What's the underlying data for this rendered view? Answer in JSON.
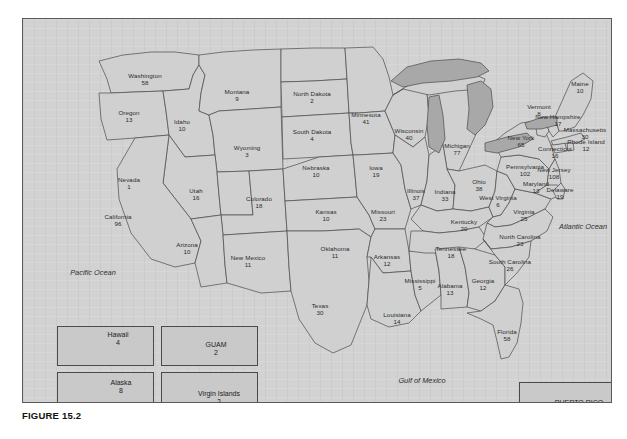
{
  "figure": {
    "caption": "FIGURE 15.2"
  },
  "map": {
    "ocean_labels": [
      {
        "name": "pacific-ocean",
        "text": "Pacific Ocean",
        "x": 70,
        "y": 253
      },
      {
        "name": "atlantic-ocean",
        "text": "Atlantic Ocean",
        "x": 560,
        "y": 207
      },
      {
        "name": "gulf-of-mexico",
        "text": "Gulf of Mexico",
        "x": 399,
        "y": 361
      }
    ],
    "states": [
      {
        "name": "washington",
        "label": "Washington",
        "value": "58",
        "x": 122,
        "y": 60
      },
      {
        "name": "oregon",
        "label": "Oregon",
        "value": "13",
        "x": 106,
        "y": 97
      },
      {
        "name": "idaho",
        "label": "Idaho",
        "value": "10",
        "x": 159,
        "y": 106
      },
      {
        "name": "montana",
        "label": "Montana",
        "value": "9",
        "x": 214,
        "y": 76
      },
      {
        "name": "wyoming",
        "label": "Wyoming",
        "value": "3",
        "x": 224,
        "y": 132
      },
      {
        "name": "nevada",
        "label": "Nevada",
        "value": "1",
        "x": 106,
        "y": 164
      },
      {
        "name": "utah",
        "label": "Utah",
        "value": "16",
        "x": 173,
        "y": 175
      },
      {
        "name": "california",
        "label": "California",
        "value": "96",
        "x": 95,
        "y": 201
      },
      {
        "name": "colorado",
        "label": "Colorado",
        "value": "18",
        "x": 236,
        "y": 183
      },
      {
        "name": "arizona",
        "label": "Arizona",
        "value": "10",
        "x": 164,
        "y": 229
      },
      {
        "name": "new-mexico",
        "label": "New Mexico",
        "value": "11",
        "x": 225,
        "y": 242
      },
      {
        "name": "north-dakota",
        "label": "North Dakota",
        "value": "2",
        "x": 289,
        "y": 78
      },
      {
        "name": "south-dakota",
        "label": "South Dakota",
        "value": "4",
        "x": 289,
        "y": 116
      },
      {
        "name": "nebraska",
        "label": "Nebraska",
        "value": "10",
        "x": 293,
        "y": 152
      },
      {
        "name": "kansas",
        "label": "Kansas",
        "value": "10",
        "x": 303,
        "y": 196
      },
      {
        "name": "oklahoma",
        "label": "Oklahoma",
        "value": "11",
        "x": 312,
        "y": 233
      },
      {
        "name": "texas",
        "label": "Texas",
        "value": "30",
        "x": 297,
        "y": 290
      },
      {
        "name": "minnesota",
        "label": "Minnesota",
        "value": "41",
        "x": 343,
        "y": 99
      },
      {
        "name": "iowa",
        "label": "Iowa",
        "value": "19",
        "x": 353,
        "y": 152
      },
      {
        "name": "missouri",
        "label": "Missouri",
        "value": "23",
        "x": 360,
        "y": 196
      },
      {
        "name": "arkansas",
        "label": "Arkansas",
        "value": "12",
        "x": 364,
        "y": 241
      },
      {
        "name": "louisiana",
        "label": "Louisiana",
        "value": "14",
        "x": 374,
        "y": 299
      },
      {
        "name": "wisconsin",
        "label": "Wisconsin",
        "value": "40",
        "x": 386,
        "y": 115
      },
      {
        "name": "illinois",
        "label": "Illinois",
        "value": "37",
        "x": 393,
        "y": 175
      },
      {
        "name": "mississippi",
        "label": "Mississippi",
        "value": "5",
        "x": 397,
        "y": 265
      },
      {
        "name": "michigan",
        "label": "Michigan",
        "value": "77",
        "x": 434,
        "y": 130
      },
      {
        "name": "indiana",
        "label": "Indiana",
        "value": "33",
        "x": 422,
        "y": 176
      },
      {
        "name": "tennessee",
        "label": "Tennessee",
        "value": "18",
        "x": 428,
        "y": 233
      },
      {
        "name": "alabama",
        "label": "Alabama",
        "value": "13",
        "x": 427,
        "y": 270
      },
      {
        "name": "georgia",
        "label": "Georgia",
        "value": "12",
        "x": 460,
        "y": 265
      },
      {
        "name": "ohio",
        "label": "Ohio",
        "value": "38",
        "x": 456,
        "y": 166
      },
      {
        "name": "kentucky",
        "label": "Kentucky",
        "value": "20",
        "x": 441,
        "y": 206
      },
      {
        "name": "west-virginia",
        "label": "West Virginia",
        "value": "6",
        "x": 475,
        "y": 182
      },
      {
        "name": "virginia",
        "label": "Virginia",
        "value": "25",
        "x": 501,
        "y": 196
      },
      {
        "name": "north-carolina",
        "label": "North Carolina",
        "value": "23",
        "x": 497,
        "y": 221
      },
      {
        "name": "south-carolina",
        "label": "South Carolina",
        "value": "26",
        "x": 487,
        "y": 246
      },
      {
        "name": "florida",
        "label": "Florida",
        "value": "58",
        "x": 484,
        "y": 316
      },
      {
        "name": "pennsylvania",
        "label": "Pennsylvania",
        "value": "102",
        "x": 502,
        "y": 151
      },
      {
        "name": "new-york",
        "label": "New York",
        "value": "65",
        "x": 498,
        "y": 122
      },
      {
        "name": "maryland",
        "label": "Maryland",
        "value": "13",
        "x": 513,
        "y": 168
      },
      {
        "name": "delaware",
        "label": "Delaware",
        "value": "19",
        "x": 537,
        "y": 174
      },
      {
        "name": "new-jersey",
        "label": "New Jersey",
        "value": "108",
        "x": 531,
        "y": 154
      },
      {
        "name": "connecticut",
        "label": "Connecticut",
        "value": "16",
        "x": 532,
        "y": 133
      },
      {
        "name": "rhode-island",
        "label": "Rhode Island",
        "value": "12",
        "x": 563,
        "y": 126
      },
      {
        "name": "massachusetts",
        "label": "Massachusetts",
        "value": "30",
        "x": 562,
        "y": 114
      },
      {
        "name": "new-hampshire",
        "label": "New Hampshire",
        "value": "17",
        "x": 535,
        "y": 101
      },
      {
        "name": "vermont",
        "label": "Vermont",
        "value": "8",
        "x": 516,
        "y": 91
      },
      {
        "name": "maine",
        "label": "Maine",
        "value": "10",
        "x": 557,
        "y": 68
      }
    ],
    "insets": [
      {
        "name": "hawaii",
        "label": "Hawaii",
        "value": "4",
        "box": {
          "x": 34,
          "y": 307,
          "w": 97,
          "h": 40
        },
        "label_x": 95,
        "label_y": 320
      },
      {
        "name": "guam",
        "label": "GUAM",
        "value": "2",
        "box": {
          "x": 138,
          "y": 307,
          "w": 97,
          "h": 40
        },
        "label_x": 193,
        "label_y": 330
      },
      {
        "name": "alaska",
        "label": "Alaska",
        "value": "8",
        "box": {
          "x": 34,
          "y": 353,
          "w": 97,
          "h": 40
        },
        "label_x": 98,
        "label_y": 368
      },
      {
        "name": "virgin-islands",
        "label": "Virgin Islands",
        "value": "2",
        "box": {
          "x": 138,
          "y": 353,
          "w": 97,
          "h": 40
        },
        "label_x": 196,
        "label_y": 379
      },
      {
        "name": "puerto-rico",
        "label": "PUERTO RICO",
        "value": "9",
        "box": {
          "x": 496,
          "y": 363,
          "w": 97,
          "h": 40
        },
        "label_x": 556,
        "label_y": 388
      }
    ]
  }
}
